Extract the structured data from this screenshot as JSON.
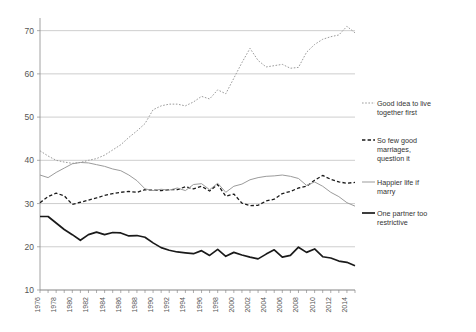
{
  "chart_data": {
    "type": "line",
    "title": "",
    "subtitle": "",
    "xlabel": "",
    "ylabel": "",
    "xlim": [
      1976,
      2015
    ],
    "ylim": [
      10,
      72
    ],
    "yticks": [
      10,
      20,
      30,
      40,
      50,
      60,
      70
    ],
    "grid": true,
    "legend_position": "right",
    "x": [
      1976,
      1977,
      1978,
      1979,
      1980,
      1981,
      1982,
      1983,
      1984,
      1985,
      1986,
      1987,
      1988,
      1989,
      1990,
      1991,
      1992,
      1993,
      1994,
      1995,
      1996,
      1997,
      1998,
      1999,
      2000,
      2001,
      2002,
      2003,
      2004,
      2005,
      2006,
      2007,
      2008,
      2009,
      2010,
      2011,
      2012,
      2013,
      2014,
      2015
    ],
    "xtick_labels": [
      "1976",
      "1978",
      "1980",
      "1982",
      "1984",
      "1986",
      "1988",
      "1990",
      "1992",
      "1994",
      "1996",
      "1998",
      "2000",
      "2002",
      "2004",
      "2006",
      "2008",
      "2010",
      "2012",
      "2014"
    ],
    "series": [
      {
        "name": "Good idea to live together first",
        "style": "dotted",
        "color": "#9b9b9b",
        "width": 1.0,
        "values": [
          42.2,
          41.0,
          40.0,
          39.6,
          39.3,
          39.5,
          40.0,
          40.4,
          41.2,
          42.4,
          43.6,
          45.3,
          46.8,
          48.5,
          51.7,
          52.6,
          53.0,
          53.0,
          52.6,
          53.5,
          54.8,
          54.2,
          56.3,
          55.4,
          59.0,
          62.6,
          65.9,
          63.1,
          61.6,
          61.9,
          62.2,
          61.3,
          61.5,
          65.0,
          66.8,
          68.0,
          68.6,
          69.0,
          71.0,
          69.5
        ]
      },
      {
        "name": "So few good marriages, question it",
        "style": "dashed",
        "color": "#1a1a1a",
        "width": 1.3,
        "values": [
          30.2,
          31.6,
          32.4,
          31.8,
          29.8,
          30.3,
          30.8,
          31.3,
          31.9,
          32.3,
          32.6,
          32.8,
          32.6,
          33.2,
          33.1,
          33.0,
          33.2,
          33.2,
          33.9,
          33.4,
          34.0,
          32.9,
          34.4,
          31.7,
          32.2,
          30.1,
          29.5,
          29.6,
          30.6,
          31.0,
          32.3,
          32.8,
          33.6,
          34.0,
          35.4,
          36.5,
          35.6,
          35.0,
          34.7,
          34.9
        ]
      },
      {
        "name": "Happier life if marry",
        "style": "solid",
        "color": "#9b9b9b",
        "width": 1.0,
        "values": [
          36.6,
          36.0,
          37.2,
          38.2,
          39.2,
          39.5,
          39.4,
          39.0,
          38.6,
          38.0,
          37.6,
          36.6,
          35.3,
          33.4,
          33.0,
          33.3,
          33.1,
          33.6,
          33.0,
          34.4,
          34.6,
          33.2,
          34.7,
          32.6,
          34.0,
          34.5,
          35.5,
          36.0,
          36.3,
          36.4,
          36.6,
          36.3,
          35.8,
          34.2,
          35.0,
          34.0,
          32.6,
          31.6,
          30.2,
          29.4
        ]
      },
      {
        "name": "One partner too restrictive",
        "style": "solid",
        "color": "#1a1a1a",
        "width": 1.7,
        "values": [
          27.0,
          27.0,
          25.5,
          24.0,
          22.8,
          21.5,
          22.8,
          23.4,
          22.8,
          23.3,
          23.2,
          22.5,
          22.6,
          22.2,
          20.9,
          19.8,
          19.2,
          18.8,
          18.6,
          18.4,
          19.1,
          18.0,
          19.4,
          17.8,
          18.7,
          18.1,
          17.6,
          17.2,
          18.3,
          19.3,
          17.6,
          18.0,
          19.9,
          18.7,
          19.5,
          17.7,
          17.4,
          16.7,
          16.4,
          15.6
        ]
      }
    ]
  },
  "legend": {
    "items": [
      {
        "label": "Good idea to live together first"
      },
      {
        "label": "So few good marriages, question it"
      },
      {
        "label": "Happier life if marry"
      },
      {
        "label": "One partner too restrictive"
      }
    ]
  }
}
